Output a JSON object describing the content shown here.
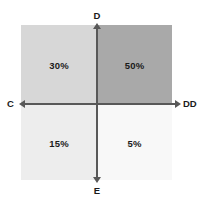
{
  "chart_data": {
    "type": "pie",
    "title": "",
    "subtitle": "",
    "xlabel": "",
    "ylabel": "",
    "legend_position": "none",
    "grid": false,
    "categories": [
      "30%",
      "50%",
      "15%",
      "5%"
    ],
    "values": [
      30,
      50,
      15,
      5
    ],
    "quadrants": [
      {
        "id": "top-left",
        "label": "30%",
        "value": 30,
        "fill": "#d7d7d7",
        "x_axis_side": "C",
        "y_axis_side": "D"
      },
      {
        "id": "top-right",
        "label": "50%",
        "value": 50,
        "fill": "#a9a9a9",
        "x_axis_side": "DD",
        "y_axis_side": "D"
      },
      {
        "id": "bottom-left",
        "label": "15%",
        "value": 15,
        "fill": "#ededed",
        "x_axis_side": "C",
        "y_axis_side": "E"
      },
      {
        "id": "bottom-right",
        "label": "5%",
        "value": 5,
        "fill": "#f8f8f8",
        "x_axis_side": "DD",
        "y_axis_side": "E"
      }
    ],
    "axes": {
      "top_label": "D",
      "bottom_label": "E",
      "left_label": "C",
      "right_label": "DD",
      "axis_color": "#585858",
      "arrows": [
        "up",
        "down",
        "left",
        "right"
      ]
    },
    "colors": {
      "background": "#ffffff",
      "text": "#1a1a1a",
      "axis": "#585858"
    }
  }
}
